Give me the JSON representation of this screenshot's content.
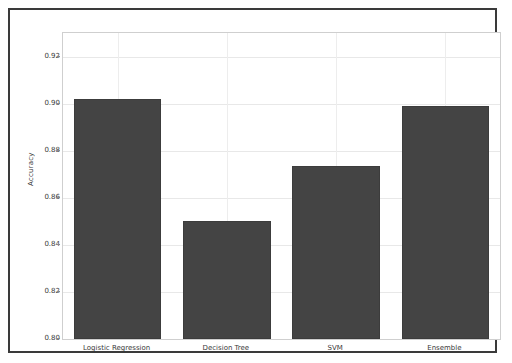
{
  "chart_data": {
    "type": "bar",
    "title": "",
    "xlabel": "",
    "ylabel": "Accuracy",
    "categories": [
      "Logistic Regression",
      "Decision Tree",
      "SVM",
      "Ensemble"
    ],
    "values": [
      0.902,
      0.85,
      0.8735,
      0.899
    ],
    "ylim": [
      0.8,
      0.93
    ],
    "yticks": [
      0.8,
      0.82,
      0.84,
      0.86,
      0.88,
      0.9,
      0.92
    ],
    "ytick_labels": [
      "0.80",
      "0.82",
      "0.84",
      "0.86",
      "0.88",
      "0.90",
      "0.92"
    ],
    "grid": true,
    "legend": false,
    "legend_position": "none",
    "bar_color": "#444444",
    "background_color": "#ffffff",
    "frame_color": "#3a3a3a",
    "gridline_color": "#e8e8e8",
    "series": [
      {
        "name": "Accuracy",
        "values": [
          0.902,
          0.85,
          0.8735,
          0.899
        ]
      }
    ]
  }
}
